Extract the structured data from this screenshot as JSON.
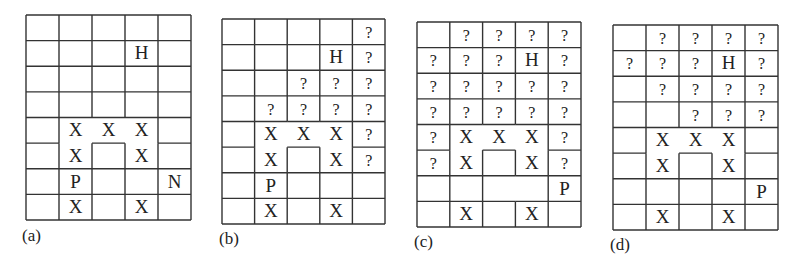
{
  "figure": {
    "stroke_color": "#333333",
    "text_color": "#222222",
    "rows": 8,
    "cols": 5,
    "room": {
      "description": "X-enclosure: merged cells without internal lines",
      "cells": [
        [
          4,
          1
        ],
        [
          4,
          2
        ],
        [
          4,
          3
        ],
        [
          5,
          1
        ],
        [
          5,
          3
        ]
      ],
      "inner_box": [
        5,
        2
      ]
    },
    "panels": [
      {
        "caption": "(a)",
        "box": {
          "left": 25,
          "top": 14,
          "width": 165,
          "height": 205
        },
        "caption_pos": {
          "left": 22,
          "top": 226
        },
        "cells": [
          [
            "",
            "",
            "",
            "",
            ""
          ],
          [
            "",
            "",
            "",
            "H",
            ""
          ],
          [
            "",
            "",
            "",
            "",
            ""
          ],
          [
            "",
            "",
            "",
            "",
            ""
          ],
          [
            "",
            "X",
            "X",
            "X",
            ""
          ],
          [
            "",
            "X",
            "",
            "X",
            ""
          ],
          [
            "",
            "P",
            "",
            "",
            "N"
          ],
          [
            "",
            "X",
            "",
            "X",
            ""
          ]
        ],
        "missing_vlines": []
      },
      {
        "caption": "(b)",
        "box": {
          "left": 221,
          "top": 18,
          "width": 163,
          "height": 205
        },
        "caption_pos": {
          "left": 219,
          "top": 229
        },
        "cells": [
          [
            "",
            "",
            "",
            "",
            "?"
          ],
          [
            "",
            "",
            "",
            "H",
            "?"
          ],
          [
            "",
            "",
            "?",
            "?",
            "?"
          ],
          [
            "",
            "?",
            "?",
            "?",
            "?"
          ],
          [
            "",
            "X",
            "X",
            "X",
            "?"
          ],
          [
            "",
            "X",
            "",
            "X",
            "?"
          ],
          [
            "",
            "P",
            "",
            "",
            ""
          ],
          [
            "",
            "X",
            "",
            "X",
            ""
          ]
        ],
        "missing_vlines": []
      },
      {
        "caption": "(c)",
        "box": {
          "left": 416,
          "top": 21,
          "width": 164,
          "height": 205
        },
        "caption_pos": {
          "left": 414,
          "top": 232
        },
        "cells": [
          [
            "",
            "?",
            "?",
            "?",
            "?"
          ],
          [
            "?",
            "?",
            "?",
            "H",
            "?"
          ],
          [
            "?",
            "?",
            "?",
            "?",
            "?"
          ],
          [
            "?",
            "?",
            "?",
            "?",
            "?"
          ],
          [
            "?",
            "X",
            "X",
            "X",
            "?"
          ],
          [
            "?",
            "X",
            "",
            "X",
            "?"
          ],
          [
            "",
            "",
            "",
            "",
            "P"
          ],
          [
            "",
            "X",
            "",
            "X",
            ""
          ]
        ],
        "missing_vlines": [
          [
            6,
            3
          ]
        ]
      },
      {
        "caption": "(d)",
        "box": {
          "left": 612,
          "top": 24,
          "width": 165,
          "height": 205
        },
        "caption_pos": {
          "left": 610,
          "top": 235
        },
        "cells": [
          [
            "",
            "?",
            "?",
            "?",
            "?"
          ],
          [
            "?",
            "?",
            "?",
            "H",
            "?"
          ],
          [
            "",
            "?",
            "?",
            "?",
            "?"
          ],
          [
            "",
            "",
            "?",
            "?",
            "?"
          ],
          [
            "",
            "X",
            "X",
            "X",
            ""
          ],
          [
            "",
            "X",
            "",
            "X",
            ""
          ],
          [
            "",
            "",
            "",
            "",
            "P"
          ],
          [
            "",
            "X",
            "",
            "X",
            ""
          ]
        ],
        "missing_vlines": []
      }
    ]
  }
}
